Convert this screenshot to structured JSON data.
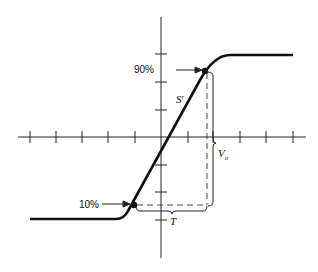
{
  "diagram": {
    "type": "step-response-slew-rate",
    "labels": {
      "upper_point": "90%",
      "lower_point": "10%",
      "slope": "S",
      "slope_sub": "r",
      "amplitude": "V",
      "amplitude_sub": "o",
      "time": "T"
    },
    "axes": {
      "horizontal_ticks_left": 5,
      "horizontal_ticks_right": 5,
      "vertical_ticks_above": 3,
      "vertical_ticks_below": 3
    },
    "colors": {
      "stroke": "#111111",
      "background": "#ffffff"
    }
  }
}
